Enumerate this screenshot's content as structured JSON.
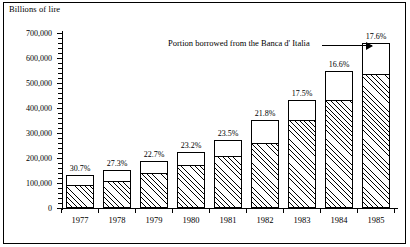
{
  "chart_data": {
    "type": "bar",
    "title": "",
    "ylabel": "Billions of lire",
    "xlabel": "",
    "ylim": [
      0,
      700000
    ],
    "grid": false,
    "legend_position": "none",
    "categories": [
      "1977",
      "1978",
      "1979",
      "1980",
      "1981",
      "1982",
      "1983",
      "1984",
      "1985"
    ],
    "y_tick_labels": [
      "0",
      "100,000",
      "200,000",
      "300,000",
      "400,000",
      "500,000",
      "600,000",
      "700,000"
    ],
    "y_tick_values": [
      0,
      100000,
      200000,
      300000,
      400000,
      500000,
      600000,
      700000
    ],
    "y_minor_tick_interval": 20000,
    "series": [
      {
        "name": "Portion borrowed from the Banca d' Italia",
        "style": "hatched",
        "values": [
          92000,
          108000,
          140000,
          172000,
          208000,
          260000,
          352000,
          432000,
          535000
        ]
      },
      {
        "name": "Remaining portion",
        "style": "white",
        "values": [
          40000,
          46000,
          48000,
          52000,
          64000,
          92000,
          80000,
          116000,
          125000
        ]
      }
    ],
    "totals": [
      132000,
      154000,
      188000,
      224000,
      272000,
      352000,
      432000,
      548000,
      660000
    ],
    "data_labels": [
      "30.7%",
      "27.3%",
      "22.7%",
      "23.2%",
      "23.5%",
      "21.8%",
      "17.5%",
      "16.6%",
      "17.6%"
    ],
    "annotations": [
      {
        "text": "Portion borrowed from the Banca d' Italia",
        "points_to": "1985",
        "has_arrow": true
      }
    ]
  },
  "colors": {
    "ink": "#000000",
    "background": "#ffffff"
  }
}
